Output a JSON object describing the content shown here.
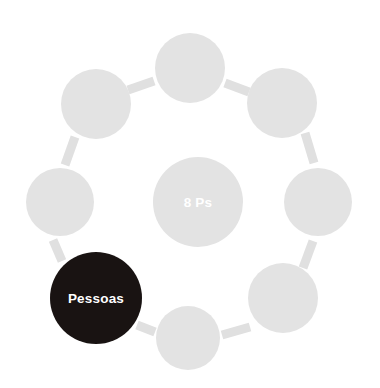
{
  "diagram": {
    "title": "8 Ps",
    "type": "circular-ring-diagram",
    "background_color": "#ffffff",
    "node_fill_default": "#e3e3e3",
    "node_fill_highlight": "#191312",
    "connector_color": "#e0e0e0",
    "label_color": "#ffffff",
    "center": {
      "label": "8 Ps",
      "cx": 198,
      "cy": 202,
      "r": 45,
      "fill": "#e3e3e3",
      "text_fill": "#ffffff"
    },
    "nodes": [
      {
        "id": "node-top",
        "label": "",
        "cx": 190,
        "cy": 68,
        "r": 35,
        "fill": "#e3e3e3",
        "highlighted": false
      },
      {
        "id": "node-top-right",
        "label": "",
        "cx": 282,
        "cy": 103,
        "r": 35,
        "fill": "#e3e3e3",
        "highlighted": false
      },
      {
        "id": "node-right",
        "label": "",
        "cx": 318,
        "cy": 202,
        "r": 34,
        "fill": "#e3e3e3",
        "highlighted": false
      },
      {
        "id": "node-bottom-right",
        "label": "",
        "cx": 283,
        "cy": 298,
        "r": 35,
        "fill": "#e3e3e3",
        "highlighted": false
      },
      {
        "id": "node-bottom",
        "label": "",
        "cx": 188,
        "cy": 338,
        "r": 32,
        "fill": "#e3e3e3",
        "highlighted": false
      },
      {
        "id": "node-bottom-left",
        "label": "Pessoas",
        "cx": 96,
        "cy": 298,
        "r": 46,
        "fill": "#191312",
        "highlighted": true
      },
      {
        "id": "node-left",
        "label": "",
        "cx": 60,
        "cy": 202,
        "r": 34,
        "fill": "#e3e3e3",
        "highlighted": false
      },
      {
        "id": "node-top-left",
        "label": "",
        "cx": 96,
        "cy": 104,
        "r": 35,
        "fill": "#e3e3e3",
        "highlighted": false
      }
    ],
    "connectors": [
      {
        "id": "connector-top-to-top-right",
        "x1": 225,
        "y1": 83,
        "x2": 249,
        "y2": 92
      },
      {
        "id": "connector-top-right-to-right",
        "x1": 305,
        "y1": 133,
        "x2": 314,
        "y2": 163
      },
      {
        "id": "connector-right-to-bottom-right",
        "x1": 313,
        "y1": 241,
        "x2": 303,
        "y2": 268
      },
      {
        "id": "connector-bottom-right-to-bottom",
        "x1": 250,
        "y1": 327,
        "x2": 222,
        "y2": 335
      },
      {
        "id": "connector-bottom-to-bottom-left",
        "x1": 155,
        "y1": 332,
        "x2": 137,
        "y2": 325
      },
      {
        "id": "connector-bottom-left-to-left",
        "x1": 62,
        "y1": 261,
        "x2": 53,
        "y2": 240
      },
      {
        "id": "connector-left-to-top-left",
        "x1": 65,
        "y1": 165,
        "x2": 75,
        "y2": 137
      },
      {
        "id": "connector-top-left-to-top",
        "x1": 128,
        "y1": 90,
        "x2": 154,
        "y2": 81
      }
    ]
  }
}
